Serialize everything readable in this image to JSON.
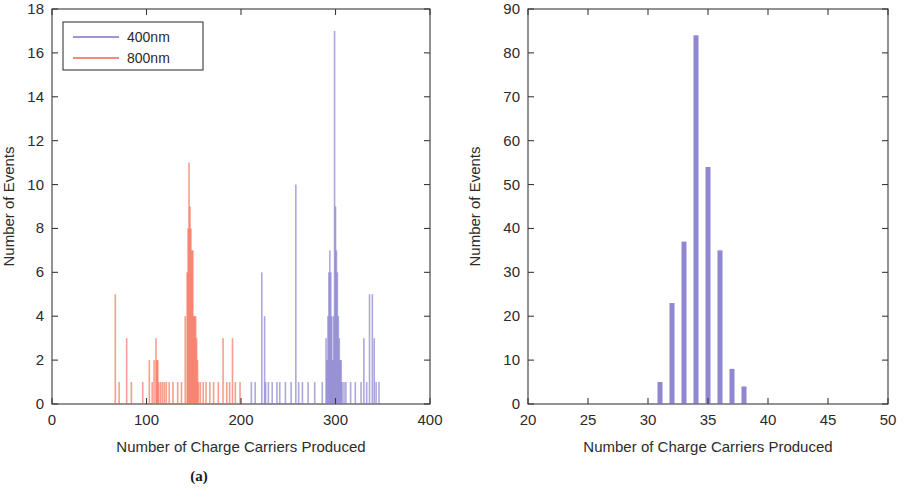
{
  "figure": {
    "background_color": "#ffffff",
    "panels": [
      {
        "id": "a",
        "caption": "(a)",
        "colors": {
          "series_400nm": "#7B72C8",
          "series_800nm": "#F4634A"
        }
      },
      {
        "id": "b",
        "caption": "(b)",
        "colors": {
          "series_400nm": "#7B72C8"
        }
      }
    ]
  },
  "chart_data": [
    {
      "panel": "a",
      "type": "bar",
      "title": "",
      "xlabel": "Number of Charge Carriers Produced",
      "ylabel": "Number of Events",
      "xlim": [
        0,
        400
      ],
      "ylim": [
        0,
        18
      ],
      "xticks": [
        0,
        100,
        200,
        300,
        400
      ],
      "yticks": [
        0,
        2,
        4,
        6,
        8,
        10,
        12,
        14,
        16,
        18
      ],
      "xtick_labels": [
        "0",
        "100",
        "200",
        "300",
        "400"
      ],
      "ytick_labels": [
        "0",
        "2",
        "4",
        "6",
        "8",
        "10",
        "12",
        "14",
        "16",
        "18"
      ],
      "grid": false,
      "legend_position": "upper left",
      "series": [
        {
          "name": "400nm",
          "color": "#7B72C8",
          "x": [
            211,
            215,
            222,
            225,
            226,
            229,
            233,
            238,
            241,
            247,
            253,
            258,
            261,
            265,
            271,
            278,
            286,
            290,
            291,
            292,
            293,
            294,
            295,
            296,
            297,
            298,
            299,
            300,
            301,
            302,
            303,
            304,
            305,
            306,
            307,
            309,
            311,
            316,
            321,
            327,
            330,
            333,
            336,
            339,
            341,
            343,
            346
          ],
          "values": [
            1,
            1,
            6,
            4,
            1,
            1,
            1,
            1,
            1,
            1,
            1,
            10,
            1,
            1,
            1,
            1,
            1,
            3,
            2,
            4,
            6,
            7,
            6,
            4,
            2,
            4,
            17,
            9,
            7,
            6,
            4,
            3,
            2,
            2,
            1,
            1,
            1,
            1,
            1,
            1,
            3,
            1,
            5,
            5,
            3,
            1,
            1
          ]
        },
        {
          "name": "800nm",
          "color": "#F4634A",
          "x": [
            67,
            71,
            79,
            84,
            96,
            103,
            106,
            108,
            110,
            111,
            112,
            113,
            115,
            117,
            119,
            121,
            124,
            128,
            133,
            137,
            141,
            143,
            144,
            145,
            146,
            147,
            148,
            149,
            150,
            151,
            152,
            153,
            154,
            155,
            157,
            160,
            163,
            167,
            171,
            176,
            181,
            185,
            188,
            191,
            194,
            199
          ],
          "values": [
            5,
            1,
            3,
            1,
            1,
            2,
            1,
            2,
            3,
            2,
            2,
            1,
            1,
            1,
            1,
            1,
            1,
            1,
            1,
            1,
            4,
            6,
            8,
            11,
            9,
            8,
            7,
            7,
            4,
            4,
            4,
            3,
            2,
            1,
            1,
            1,
            1,
            1,
            1,
            1,
            3,
            1,
            1,
            3,
            1,
            1
          ]
        }
      ]
    },
    {
      "panel": "b",
      "type": "bar",
      "title": "",
      "xlabel": "Number of Charge Carriers Produced",
      "ylabel": "Number of Events",
      "xlim": [
        20,
        50
      ],
      "ylim": [
        0,
        90
      ],
      "xticks": [
        20,
        25,
        30,
        35,
        40,
        45,
        50
      ],
      "yticks": [
        0,
        10,
        20,
        30,
        40,
        50,
        60,
        70,
        80,
        90
      ],
      "xtick_labels": [
        "20",
        "25",
        "30",
        "35",
        "40",
        "45",
        "50"
      ],
      "ytick_labels": [
        "0",
        "10",
        "20",
        "30",
        "40",
        "50",
        "60",
        "70",
        "80",
        "90"
      ],
      "grid": false,
      "legend_position": "none",
      "series": [
        {
          "name": "400nm",
          "color": "#7B72C8",
          "x": [
            31,
            32,
            33,
            34,
            35,
            36,
            37,
            38
          ],
          "values": [
            5,
            23,
            37,
            84,
            54,
            35,
            8,
            4
          ]
        }
      ]
    }
  ],
  "legend": {
    "panel_a": {
      "entries": [
        {
          "label": "400nm",
          "color": "#7B72C8"
        },
        {
          "label": "800nm",
          "color": "#F4634A"
        }
      ]
    }
  }
}
